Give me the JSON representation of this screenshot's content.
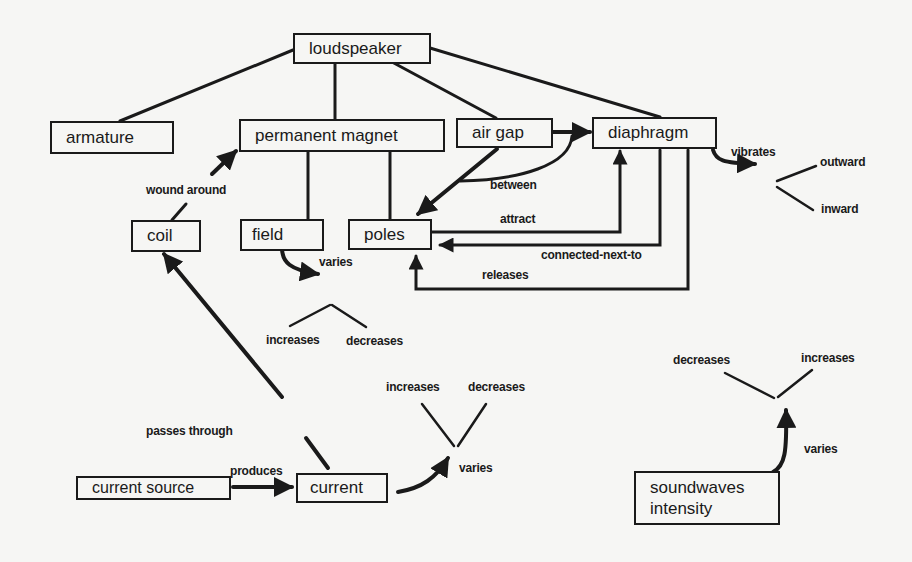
{
  "diagram": {
    "type": "concept-map",
    "nodes": {
      "loudspeaker": "loudspeaker",
      "armature": "armature",
      "permanent_magnet": "permanent magnet",
      "air_gap": "air gap",
      "diaphragm": "diaphragm",
      "coil": "coil",
      "field": "field",
      "poles": "poles",
      "current_source": "current source",
      "current": "current",
      "soundwaves_line1": "soundwaves",
      "soundwaves_line2": "intensity"
    },
    "edge_labels": {
      "wound_around": "wound around",
      "between": "between",
      "vibrates": "vibrates",
      "attract": "attract",
      "connected_next_to": "connected-next-to",
      "releases": "releases",
      "field_varies": "varies",
      "passes_through": "passes through",
      "produces": "produces",
      "current_varies": "varies",
      "sound_varies": "varies"
    },
    "values": {
      "outward": "outward",
      "inward": "inward",
      "field_increases": "increases",
      "field_decreases": "decreases",
      "current_increases": "increases",
      "current_decreases": "decreases",
      "sound_decreases": "decreases",
      "sound_increases": "increases"
    },
    "edges": [
      {
        "from": "loudspeaker",
        "to": "armature"
      },
      {
        "from": "loudspeaker",
        "to": "permanent magnet"
      },
      {
        "from": "loudspeaker",
        "to": "air gap"
      },
      {
        "from": "loudspeaker",
        "to": "diaphragm"
      },
      {
        "from": "permanent magnet",
        "to": "field"
      },
      {
        "from": "permanent magnet",
        "to": "poles"
      },
      {
        "from": "coil",
        "to": "permanent magnet",
        "label": "wound around"
      },
      {
        "from": "air gap",
        "to": "diaphragm"
      },
      {
        "from": "air gap",
        "to": "poles",
        "label": "between"
      },
      {
        "from": "poles",
        "to": "diaphragm",
        "label": "attract"
      },
      {
        "from": "diaphragm",
        "to": "poles",
        "label": "connected-next-to"
      },
      {
        "from": "diaphragm",
        "to": "poles",
        "label": "releases"
      },
      {
        "from": "diaphragm",
        "to": "outward/inward",
        "label": "vibrates"
      },
      {
        "from": "field",
        "to": "increases/decreases",
        "label": "varies"
      },
      {
        "from": "current",
        "to": "coil",
        "label": "passes through"
      },
      {
        "from": "current source",
        "to": "current",
        "label": "produces"
      },
      {
        "from": "current",
        "to": "increases/decreases",
        "label": "varies"
      },
      {
        "from": "soundwaves intensity",
        "to": "decreases/increases",
        "label": "varies"
      }
    ]
  }
}
